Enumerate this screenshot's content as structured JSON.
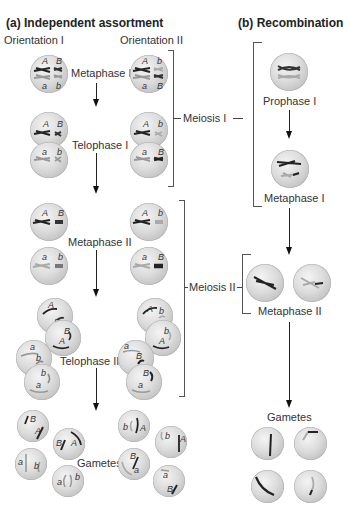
{
  "panel_a": {
    "title": "(a)  Independent assortment",
    "col1": "Orientation I",
    "col2": "Orientation II",
    "stages": {
      "metaphase1": "Metaphase I",
      "telophase1": "Telophase I",
      "metaphase2": "Metaphase II",
      "telophase2": "Telophase II",
      "gametes": "Gametes"
    },
    "orientation1": {
      "metaphase1": {
        "top": [
          "A",
          "B"
        ],
        "bottom": [
          "a",
          "b"
        ]
      },
      "telophase1": {
        "top": [
          "A",
          "B"
        ],
        "bottom": [
          "a",
          "b"
        ]
      },
      "metaphase2": {
        "top": [
          "A",
          "B"
        ],
        "bottom": [
          "a",
          "b"
        ]
      },
      "telophase2": {
        "cell1": [
          "A",
          "B",
          "B",
          "A"
        ],
        "cell2": [
          "a",
          "b",
          "b",
          "a"
        ]
      },
      "gametes": [
        [
          "B",
          "A"
        ],
        [
          "B",
          "A"
        ],
        [
          "a",
          "b"
        ],
        [
          "a",
          "b"
        ]
      ]
    },
    "orientation2": {
      "metaphase1": {
        "top": [
          "A",
          "b"
        ],
        "bottom": [
          "a",
          "B"
        ]
      },
      "telophase1": {
        "top": [
          "A",
          "b"
        ],
        "bottom": [
          "a",
          "B"
        ]
      },
      "metaphase2": {
        "top": [
          "A",
          "b"
        ],
        "bottom": [
          "a",
          "B"
        ]
      },
      "telophase2": {
        "cell1": [
          "A",
          "b",
          "b",
          "A"
        ],
        "cell2": [
          "a",
          "B",
          "B",
          "a"
        ]
      },
      "gametes": [
        [
          "b",
          "A"
        ],
        [
          "b",
          "A"
        ],
        [
          "B",
          "a"
        ],
        [
          "a",
          "B"
        ]
      ]
    }
  },
  "panel_b": {
    "title": "(b)  Recombination",
    "stages": {
      "prophase1": "Prophase I",
      "metaphase1": "Metaphase I",
      "metaphase2": "Metaphase II",
      "gametes": "Gametes"
    }
  },
  "brackets": {
    "meiosis1": "Meiosis I",
    "meiosis2": "Meiosis II"
  }
}
